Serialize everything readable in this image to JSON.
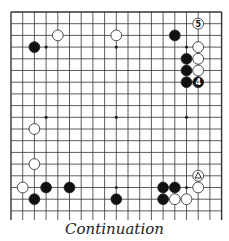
{
  "caption": "Continuation",
  "board": {
    "size": 19,
    "left": 11,
    "top": 12,
    "spacing": 11.7
  },
  "star_points": [
    [
      3,
      3
    ],
    [
      9,
      3
    ],
    [
      15,
      3
    ],
    [
      3,
      9
    ],
    [
      9,
      9
    ],
    [
      15,
      9
    ],
    [
      3,
      15
    ],
    [
      9,
      15
    ],
    [
      15,
      15
    ]
  ],
  "stones": [
    {
      "color": "black",
      "col": 2,
      "row": 3
    },
    {
      "color": "white",
      "col": 4,
      "row": 2
    },
    {
      "color": "white",
      "col": 9,
      "row": 2
    },
    {
      "color": "black",
      "col": 14,
      "row": 2
    },
    {
      "color": "white",
      "col": 16,
      "row": 1,
      "label": "5"
    },
    {
      "color": "white",
      "col": 16,
      "row": 3
    },
    {
      "color": "white",
      "col": 16,
      "row": 4
    },
    {
      "color": "white",
      "col": 16,
      "row": 5
    },
    {
      "color": "black",
      "col": 16,
      "row": 6,
      "label": "4"
    },
    {
      "color": "black",
      "col": 15,
      "row": 4
    },
    {
      "color": "black",
      "col": 15,
      "row": 5
    },
    {
      "color": "black",
      "col": 15,
      "row": 6
    },
    {
      "color": "white",
      "col": 2,
      "row": 10
    },
    {
      "color": "white",
      "col": 2,
      "row": 13
    },
    {
      "color": "white",
      "col": 1,
      "row": 15
    },
    {
      "color": "black",
      "col": 3,
      "row": 15
    },
    {
      "color": "black",
      "col": 5,
      "row": 15
    },
    {
      "color": "black",
      "col": 2,
      "row": 16
    },
    {
      "color": "black",
      "col": 9,
      "row": 16
    },
    {
      "color": "white",
      "col": 16,
      "row": 14,
      "mark": "triangle"
    },
    {
      "color": "black",
      "col": 13,
      "row": 15
    },
    {
      "color": "black",
      "col": 14,
      "row": 15
    },
    {
      "color": "white",
      "col": 16,
      "row": 15
    },
    {
      "color": "black",
      "col": 13,
      "row": 16
    },
    {
      "color": "white",
      "col": 14,
      "row": 16
    },
    {
      "color": "white",
      "col": 15,
      "row": 16
    }
  ]
}
